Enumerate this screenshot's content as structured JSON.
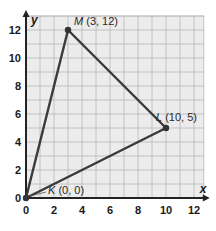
{
  "chart_data": {
    "type": "scatter",
    "title": "",
    "xlabel": "x",
    "ylabel": "y",
    "xlim": [
      0,
      12.7
    ],
    "ylim": [
      0,
      13
    ],
    "grid": true,
    "grid_step": 1,
    "x_ticks": [
      0,
      2,
      4,
      6,
      8,
      10,
      12
    ],
    "y_ticks": [
      0,
      2,
      4,
      6,
      8,
      10,
      12
    ],
    "x_tick_labels": [
      "0",
      "2",
      "4",
      "6",
      "8",
      "10",
      "12"
    ],
    "y_tick_labels": [
      "0",
      "2",
      "4",
      "6",
      "8",
      "10",
      "12"
    ],
    "points": [
      {
        "name": "K",
        "x": 0,
        "y": 0,
        "label": "K (0, 0)"
      },
      {
        "name": "L",
        "x": 10,
        "y": 5,
        "label": "L (10, 5)"
      },
      {
        "name": "M",
        "x": 3,
        "y": 12,
        "label": "M (3, 12)"
      }
    ],
    "polygon": [
      "K",
      "L",
      "M"
    ],
    "shape": "triangle KLM",
    "colors": {
      "grid_background": "#ececec",
      "grid_line": "#b8b8b8",
      "axis": "#222222",
      "triangle": "#3a3a3a",
      "point": "#333333"
    }
  }
}
